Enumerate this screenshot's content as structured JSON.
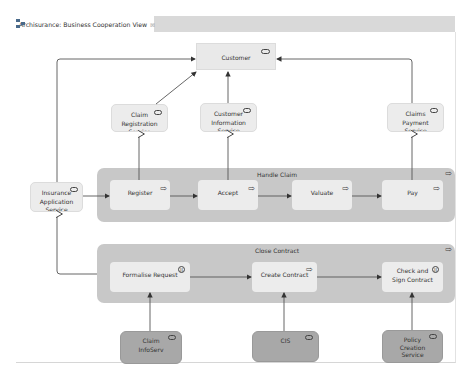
{
  "tab": {
    "title": "Archisurance: Business Cooperation View",
    "icon": "diagram-icon",
    "close_glyph": "⊠"
  },
  "colors": {
    "canvas": "#ffffff",
    "container": "#c8c8c8",
    "element": "#ececec",
    "tech_service": "#a8a8a8",
    "line": "#555555"
  },
  "actor": {
    "label": "Customer",
    "icon": "role-icon"
  },
  "services": {
    "claim_registration": {
      "label": "Claim Registration Service",
      "icon": "service-icon"
    },
    "customer_information": {
      "label": "Customer Information Service",
      "icon": "service-icon"
    },
    "claims_payment": {
      "label": "Claims Payment Service",
      "icon": "service-icon"
    },
    "insurance_application": {
      "label": "Insurance Application Service",
      "icon": "service-icon"
    }
  },
  "handle_claim": {
    "title": "Handle Claim",
    "icon": "process-icon",
    "steps": [
      {
        "label": "Register",
        "icon": "process-icon"
      },
      {
        "label": "Accept",
        "icon": "process-icon"
      },
      {
        "label": "Valuate",
        "icon": "process-icon"
      },
      {
        "label": "Pay",
        "icon": "process-icon"
      }
    ]
  },
  "close_contract": {
    "title": "Close Contract",
    "icon": "process-icon",
    "steps": [
      {
        "label": "Formalise Request",
        "icon": "interaction-icon"
      },
      {
        "label": "Create Contract",
        "icon": "process-icon"
      },
      {
        "label": "Check and Sign Contract",
        "icon": "interaction-icon"
      }
    ]
  },
  "tech_services": [
    {
      "label": "Claim InfoServ",
      "icon": "service-icon"
    },
    {
      "label": "CIS",
      "icon": "service-icon"
    },
    {
      "label": "Policy Creation Service",
      "icon": "service-icon"
    }
  ]
}
